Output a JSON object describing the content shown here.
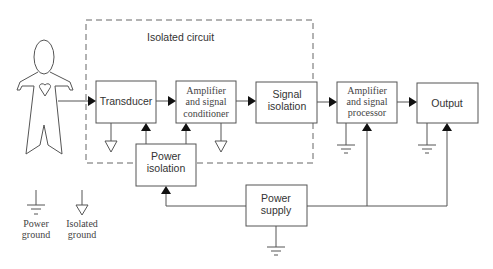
{
  "diagram": {
    "isolated_region_label": "Isolated circuit",
    "blocks": {
      "transducer": "Transducer",
      "amp_cond": [
        "Amplifier",
        "and signal",
        "conditioner"
      ],
      "signal_isolation": [
        "Signal",
        "isolation"
      ],
      "amp_proc": [
        "Amplifier",
        "and signal",
        "processor"
      ],
      "output": "Output",
      "power_isolation": [
        "Power",
        "isolation"
      ],
      "power_supply": [
        "Power",
        "supply"
      ]
    },
    "legend": {
      "power_ground": [
        "Power",
        "ground"
      ],
      "isolated_ground": [
        "Isolated",
        "ground"
      ]
    },
    "colors": {
      "line": "#555555",
      "arrow": "#111111",
      "background": "#ffffff"
    }
  }
}
